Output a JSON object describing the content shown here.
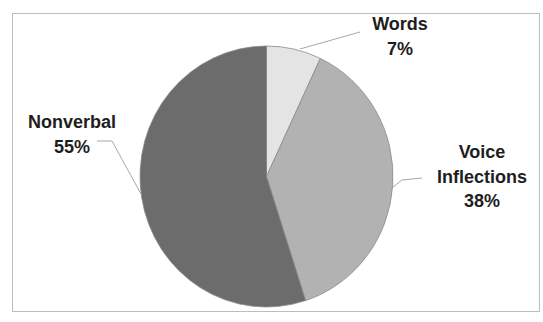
{
  "chart_data": {
    "type": "pie",
    "title": "",
    "categories": [
      "Words",
      "Voice Inflections",
      "Nonverbal"
    ],
    "values": [
      7,
      38,
      55
    ],
    "unit": "%",
    "start_angle_deg": 0,
    "direction": "clockwise",
    "colors": [
      "#e4e4e4",
      "#b2b2b2",
      "#6c6c6c"
    ],
    "legend": "none",
    "data_labels": [
      {
        "name": "Words",
        "value": "7%"
      },
      {
        "name": "Voice Inflections",
        "value": "38%"
      },
      {
        "name": "Nonverbal",
        "value": "55%"
      }
    ]
  },
  "labels": {
    "words": {
      "line1": "Words",
      "line2": "7%"
    },
    "voice": {
      "line1": "Voice",
      "line2": "Inflections",
      "line3": "38%"
    },
    "nonverbal": {
      "line1": "Nonverbal",
      "line2": "55%"
    }
  },
  "style": {
    "outline": "#8a8a8a",
    "leader": "#a8a8a8"
  }
}
